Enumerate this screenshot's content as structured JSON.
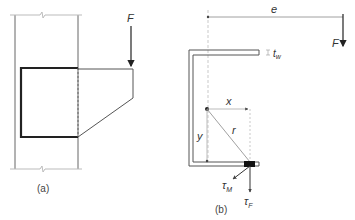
{
  "figure_a": {
    "caption": "(a)",
    "force_label": "F"
  },
  "figure_b": {
    "caption": "(b)",
    "eccentricity_label": "e",
    "force_label": "F",
    "thickness_label": "t",
    "thickness_subscript": "w",
    "x_label": "x",
    "y_label": "y",
    "r_label": "r",
    "tau_m_label": "τ",
    "tau_m_subscript": "M",
    "tau_f_label": "τ",
    "tau_f_subscript": "F"
  },
  "colors": {
    "stroke": "#555555",
    "thick": "#222222",
    "light": "#bbbbbb",
    "text": "#333333"
  }
}
